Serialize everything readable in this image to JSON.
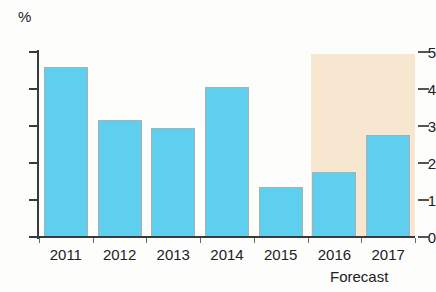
{
  "chart_data": {
    "type": "bar",
    "title": "",
    "subtitle": "",
    "xlabel": "",
    "ylabel": "%",
    "unit_label": "%",
    "categories": [
      "2011",
      "2012",
      "2013",
      "2014",
      "2015",
      "2016",
      "2017"
    ],
    "values": [
      4.6,
      3.15,
      2.95,
      4.05,
      1.35,
      1.75,
      2.75
    ],
    "series": [
      {
        "name": "Annual rate",
        "values": [
          4.6,
          3.15,
          2.95,
          4.05,
          1.35,
          1.75,
          2.75
        ]
      }
    ],
    "ylim": [
      0,
      5
    ],
    "ytick_labels": [
      "0",
      "1",
      "2",
      "3",
      "4",
      "5"
    ],
    "ytick_values": [
      0,
      1,
      2,
      3,
      4,
      5
    ],
    "grid": false,
    "legend": null,
    "annotations": [
      {
        "text": "Forecast",
        "covers_categories": [
          "2016",
          "2017"
        ],
        "kind": "shaded-band"
      }
    ],
    "colors": {
      "bar_fill": "#5ecfee",
      "bar_edge": "#a8b0b4",
      "forecast_band": "#f7e7d0",
      "axis": "#3a3a38",
      "text": "#22211f",
      "background": "#fdfdfc"
    }
  },
  "axes": {
    "unit_label": "%",
    "y_ticks": [
      {
        "label": "5",
        "value": 5
      },
      {
        "label": "4",
        "value": 4
      },
      {
        "label": "3",
        "value": 3
      },
      {
        "label": "2",
        "value": 2
      },
      {
        "label": "1",
        "value": 1
      },
      {
        "label": "0",
        "value": 0
      }
    ],
    "x_ticks": [
      {
        "label": "2011"
      },
      {
        "label": "2012"
      },
      {
        "label": "2013"
      },
      {
        "label": "2014"
      },
      {
        "label": "2015"
      },
      {
        "label": "2016"
      },
      {
        "label": "2017"
      }
    ]
  },
  "forecast": {
    "caption": "Forecast"
  }
}
